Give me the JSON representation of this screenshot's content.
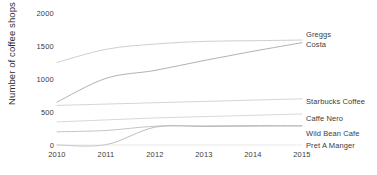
{
  "chart_data": {
    "type": "line",
    "title": "",
    "xlabel": "",
    "ylabel": "Number of coffee shops",
    "x": [
      2010,
      2011,
      2012,
      2013,
      2014,
      2015
    ],
    "xticklabels": [
      "2010",
      "2011",
      "2012",
      "2013",
      "2014",
      "2015"
    ],
    "yticklabels": [
      "0",
      "500",
      "1000",
      "1500",
      "2000"
    ],
    "yticks": [
      0,
      500,
      1000,
      1500,
      2000
    ],
    "ylim": [
      0,
      2000
    ],
    "xlim": [
      2010,
      2015
    ],
    "grid": false,
    "legend_position": "right-inline-labels",
    "series": [
      {
        "name": "Greggs",
        "color": "#c8c8c8",
        "values": [
          1250,
          1450,
          1530,
          1570,
          1580,
          1590
        ]
      },
      {
        "name": "Costa",
        "color": "#a8a8a8",
        "values": [
          650,
          1010,
          1130,
          1280,
          1420,
          1550
        ]
      },
      {
        "name": "Starbucks Coffee",
        "color": "#cfcfcf",
        "values": [
          600,
          620,
          640,
          660,
          680,
          700
        ]
      },
      {
        "name": "Caffe Nero",
        "color": "#d4d4d4",
        "values": [
          350,
          380,
          410,
          430,
          450,
          470
        ]
      },
      {
        "name": "Wild Bean Cafe",
        "color": "#bdbdbd",
        "values": [
          200,
          220,
          285,
          290,
          295,
          290
        ]
      },
      {
        "name": "Pret A Manger",
        "color": "#b5b5b5",
        "values": [
          0,
          5,
          270,
          280,
          285,
          290
        ]
      }
    ],
    "series_labels": [
      {
        "text": "Greggs",
        "top": 30
      },
      {
        "text": "Costa",
        "top": 40
      },
      {
        "text": "Starbucks Coffee",
        "top": 97
      },
      {
        "text": "Caffe Nero",
        "top": 114
      },
      {
        "text": "Wild Bean Cafe",
        "top": 129
      },
      {
        "text": "Pret A Manger",
        "top": 141
      }
    ]
  }
}
